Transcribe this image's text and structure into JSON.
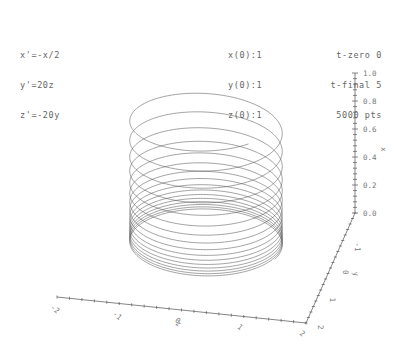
{
  "equations": [
    "x'=-x/2",
    "y'=20z",
    "z'=-20y"
  ],
  "initial_conditions": [
    "x(0):1",
    "y(0):1",
    "z(0):1"
  ],
  "parameters": [
    "t-zero 0",
    "t-final 5",
    "5000 pts"
  ],
  "colors": {
    "curve": "#555555",
    "axis": "#666666",
    "text": "#666666",
    "background": "#ffffff"
  },
  "chart_data": {
    "type": "line",
    "projection": "3d",
    "system": [
      "x'=-x/2",
      "y'=20z",
      "z'=-20y"
    ],
    "initial": {
      "x": 1,
      "y": 1,
      "z": 1
    },
    "t_range": [
      0,
      5
    ],
    "points": 5000,
    "axes": {
      "x": {
        "label": "x",
        "range": [
          0.0,
          1.0
        ],
        "ticks": [
          "0.0",
          "0.2",
          "0.4",
          "0.6",
          "0.8",
          "1.0"
        ],
        "orientation": "vertical"
      },
      "y": {
        "label": "y",
        "range": [
          -2,
          2
        ],
        "ticks": [
          "2",
          "1",
          "0",
          "-1"
        ]
      },
      "z": {
        "label": "z",
        "range": [
          -2,
          2
        ],
        "ticks": [
          "-2",
          "-1",
          "0",
          "1",
          "2"
        ]
      }
    },
    "grid": false,
    "legend": false
  }
}
